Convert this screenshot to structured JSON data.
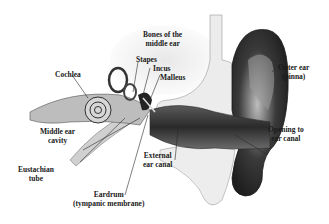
{
  "diagram": {
    "labels": {
      "bones_middle_ear": {
        "line1": "Bones of the",
        "line2": "middle ear"
      },
      "stapes": "Stapes",
      "incus": "Incus",
      "malleus": "Malleus",
      "cochlea": "Cochlea",
      "outer_ear": {
        "line1": "Outer ear",
        "line2": "(pinna)"
      },
      "middle_ear_cavity": {
        "line1": "Middle ear",
        "line2": "cavity"
      },
      "eustachian_tube": {
        "line1": "Eustachian",
        "line2": "tube"
      },
      "external_ear_canal": {
        "line1": "External",
        "line2": "ear canal"
      },
      "opening_ear_canal": {
        "line1": "Opening to",
        "line2": "ear canal"
      },
      "eardrum": {
        "line1": "Eardrum",
        "line2": "(tympanic membrane)"
      }
    },
    "colors": {
      "background": "#ffffff",
      "label_text": "#1a1a1a",
      "skin_dark": "#2a2a2a",
      "skin_mid": "#8a8a8a",
      "bone_light": "#e6e6e6"
    }
  }
}
